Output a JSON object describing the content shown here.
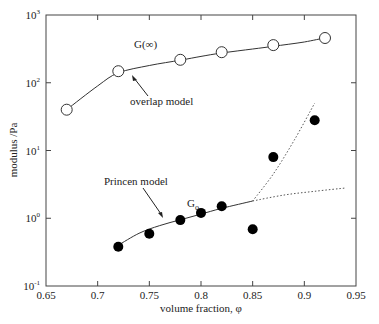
{
  "chart_data": {
    "type": "scatter",
    "title": "",
    "xlabel": "volume fraction, φ",
    "ylabel": "modulus /Pa",
    "xlim": [
      0.65,
      0.95
    ],
    "ylim": [
      0.1,
      1000
    ],
    "yscale": "log",
    "grid": false,
    "x_ticks": [
      0.65,
      0.7,
      0.75,
      0.8,
      0.85,
      0.9,
      0.95
    ],
    "x_tick_labels": [
      "0.65",
      "0.7",
      "0.75",
      "0.8",
      "0.85",
      "0.9",
      "0.95"
    ],
    "y_ticks": [
      0.1,
      1,
      10,
      100,
      1000
    ],
    "y_tick_labels": [
      {
        "base": "10",
        "exp": "-1"
      },
      {
        "base": "10",
        "exp": "0"
      },
      {
        "base": "10",
        "exp": "1"
      },
      {
        "base": "10",
        "exp": "2"
      },
      {
        "base": "10",
        "exp": "3"
      }
    ],
    "series": [
      {
        "name": "G(∞)",
        "marker": "open-circle",
        "x": [
          0.67,
          0.72,
          0.78,
          0.82,
          0.87,
          0.92
        ],
        "y": [
          40,
          148,
          218,
          282,
          360,
          457
        ]
      },
      {
        "name": "G0",
        "marker": "filled-circle",
        "x": [
          0.72,
          0.75,
          0.78,
          0.8,
          0.82,
          0.85,
          0.87,
          0.91
        ],
        "y": [
          0.38,
          0.59,
          0.94,
          1.2,
          1.5,
          0.69,
          8,
          28
        ]
      },
      {
        "name": "overlap model",
        "style": "solid-line",
        "x": [
          0.67,
          0.7,
          0.72,
          0.75,
          0.78,
          0.8,
          0.82,
          0.85,
          0.87,
          0.9,
          0.92
        ],
        "y": [
          40,
          90,
          140,
          180,
          215,
          245,
          275,
          315,
          345,
          400,
          460
        ]
      },
      {
        "name": "Princen model",
        "style": "solid-line",
        "x": [
          0.72,
          0.74,
          0.76,
          0.78,
          0.8,
          0.82,
          0.85
        ],
        "y": [
          0.4,
          0.6,
          0.78,
          0.95,
          1.15,
          1.4,
          1.8
        ]
      },
      {
        "name": "Princen extension",
        "style": "dotted-line",
        "x": [
          0.85,
          0.88,
          0.91,
          0.94
        ],
        "y": [
          1.8,
          2.2,
          2.5,
          2.8
        ]
      },
      {
        "name": "steep extension",
        "style": "dotted-line",
        "x": [
          0.85,
          0.87,
          0.89,
          0.91
        ],
        "y": [
          1.8,
          4.5,
          14,
          50
        ]
      }
    ],
    "annotations": [
      {
        "text": "G(∞)",
        "x": 0.77,
        "y": 450
      },
      {
        "text": "overlap model",
        "x": 0.78,
        "y": 45,
        "arrow_to": [
          0.755,
          190
        ]
      },
      {
        "text": "Princen model",
        "x": 0.72,
        "y": 3.2,
        "arrow_to": [
          0.763,
          0.8
        ]
      },
      {
        "text": "G",
        "sub": "o",
        "x": 0.8,
        "y": 1.8
      }
    ]
  },
  "labels": {
    "xlabel": "volume fraction, φ",
    "ylabel": "modulus /Pa",
    "g_inf": "G(∞)",
    "overlap": "overlap model",
    "princen": "Princen model",
    "g0_base": "G",
    "g0_sub": "o"
  }
}
